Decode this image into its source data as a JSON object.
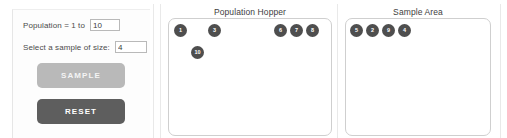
{
  "controls": {
    "population_label": "Population = 1 to",
    "population_value": "10",
    "sample_size_label": "Select a sample of size:",
    "sample_size_value": "4",
    "sample_button_label": "SAMPLE",
    "reset_button_label": "RESET"
  },
  "hopper": {
    "title": "Population Hopper",
    "tokens": [
      {
        "label": "1",
        "x": 5,
        "y": 5
      },
      {
        "label": "3",
        "x": 39,
        "y": 5
      },
      {
        "label": "6",
        "x": 105,
        "y": 5
      },
      {
        "label": "7",
        "x": 121,
        "y": 5
      },
      {
        "label": "8",
        "x": 137,
        "y": 5
      },
      {
        "label": "10",
        "x": 22,
        "y": 27
      }
    ]
  },
  "sample_area": {
    "title": "Sample Area",
    "tokens": [
      {
        "label": "5",
        "x": 4,
        "y": 5
      },
      {
        "label": "2",
        "x": 20,
        "y": 5
      },
      {
        "label": "9",
        "x": 36,
        "y": 5
      },
      {
        "label": "4",
        "x": 52,
        "y": 5
      }
    ]
  },
  "colors": {
    "token_fill": "#4e4e4e",
    "sample_button": "#b9b9b9",
    "reset_button": "#5e5e5e",
    "panel_border": "#cfcfcf"
  }
}
